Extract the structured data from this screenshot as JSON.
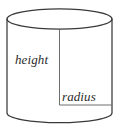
{
  "figure": {
    "type": "geometry-diagram",
    "shape": "cylinder",
    "background_color": "#ffffff",
    "stroke_color": "#3a3a3a",
    "dimension_line_color": "#6e6e6e",
    "text_color": "#2b2b2b",
    "labels": {
      "height": "height",
      "radius": "radius"
    },
    "geometry": {
      "center_x": 59.5,
      "left_x": 7,
      "right_x": 112,
      "top_ellipse_center_y": 19,
      "top_ellipse_ry": 10,
      "bottom_ellipse_center_y": 113,
      "bottom_ellipse_ry": 9,
      "height_line_from_y": 28,
      "height_line_to_y": 105,
      "radius_line_y": 105,
      "radius_line_from_x": 59.5,
      "radius_line_to_x": 112
    }
  }
}
